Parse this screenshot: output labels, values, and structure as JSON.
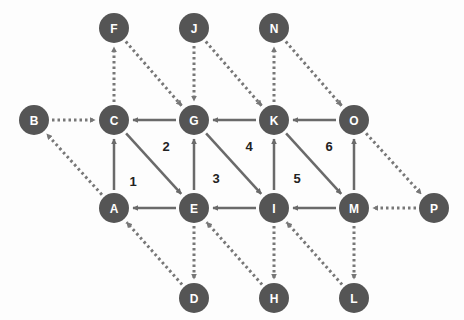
{
  "colors": {
    "node_fill": "#555555",
    "node_text": "#ffffff",
    "edge_solid": "#6a6a6a",
    "edge_dotted": "#777777",
    "region_label": "#222222",
    "background": "#fdfdfd"
  },
  "node_radius": 15,
  "nodes": [
    {
      "id": "F",
      "x": 114,
      "y": 28
    },
    {
      "id": "J",
      "x": 194,
      "y": 28
    },
    {
      "id": "N",
      "x": 274,
      "y": 28
    },
    {
      "id": "B",
      "x": 34,
      "y": 120
    },
    {
      "id": "C",
      "x": 114,
      "y": 120
    },
    {
      "id": "G",
      "x": 194,
      "y": 120
    },
    {
      "id": "K",
      "x": 274,
      "y": 120
    },
    {
      "id": "O",
      "x": 354,
      "y": 120
    },
    {
      "id": "A",
      "x": 114,
      "y": 208
    },
    {
      "id": "E",
      "x": 194,
      "y": 208
    },
    {
      "id": "I",
      "x": 274,
      "y": 208
    },
    {
      "id": "M",
      "x": 354,
      "y": 208
    },
    {
      "id": "P",
      "x": 434,
      "y": 208
    },
    {
      "id": "D",
      "x": 194,
      "y": 298
    },
    {
      "id": "H",
      "x": 274,
      "y": 298
    },
    {
      "id": "L",
      "x": 354,
      "y": 298
    }
  ],
  "edges": [
    {
      "from": "G",
      "to": "C",
      "style": "solid"
    },
    {
      "from": "K",
      "to": "G",
      "style": "solid"
    },
    {
      "from": "O",
      "to": "K",
      "style": "solid"
    },
    {
      "from": "A",
      "to": "C",
      "style": "solid"
    },
    {
      "from": "E",
      "to": "G",
      "style": "solid"
    },
    {
      "from": "I",
      "to": "K",
      "style": "solid"
    },
    {
      "from": "M",
      "to": "O",
      "style": "solid"
    },
    {
      "from": "C",
      "to": "E",
      "style": "solid"
    },
    {
      "from": "G",
      "to": "I",
      "style": "solid"
    },
    {
      "from": "K",
      "to": "M",
      "style": "solid"
    },
    {
      "from": "E",
      "to": "A",
      "style": "solid"
    },
    {
      "from": "I",
      "to": "E",
      "style": "solid"
    },
    {
      "from": "M",
      "to": "I",
      "style": "solid"
    },
    {
      "from": "B",
      "to": "C",
      "style": "dotted"
    },
    {
      "from": "C",
      "to": "F",
      "style": "dotted"
    },
    {
      "from": "F",
      "to": "G",
      "style": "dotted"
    },
    {
      "from": "J",
      "to": "G",
      "style": "dotted"
    },
    {
      "from": "J",
      "to": "K",
      "style": "dotted"
    },
    {
      "from": "K",
      "to": "N",
      "style": "dotted"
    },
    {
      "from": "N",
      "to": "O",
      "style": "dotted"
    },
    {
      "from": "O",
      "to": "P",
      "style": "dotted"
    },
    {
      "from": "P",
      "to": "M",
      "style": "dotted"
    },
    {
      "from": "M",
      "to": "L",
      "style": "dotted"
    },
    {
      "from": "L",
      "to": "I",
      "style": "dotted"
    },
    {
      "from": "I",
      "to": "H",
      "style": "dotted"
    },
    {
      "from": "H",
      "to": "E",
      "style": "dotted"
    },
    {
      "from": "E",
      "to": "D",
      "style": "dotted"
    },
    {
      "from": "D",
      "to": "A",
      "style": "dotted"
    },
    {
      "from": "A",
      "to": "B",
      "style": "dotted"
    }
  ],
  "regions": [
    {
      "label": "1",
      "x": 133,
      "y": 186
    },
    {
      "label": "2",
      "x": 166,
      "y": 151
    },
    {
      "label": "3",
      "x": 216,
      "y": 183
    },
    {
      "label": "4",
      "x": 249,
      "y": 151
    },
    {
      "label": "5",
      "x": 297,
      "y": 183
    },
    {
      "label": "6",
      "x": 329,
      "y": 151
    }
  ]
}
